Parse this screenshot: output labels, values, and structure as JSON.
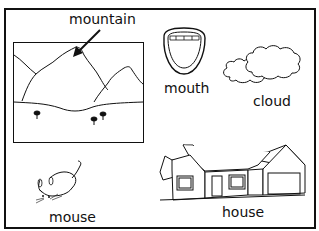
{
  "worksheet": {
    "labels": {
      "mountain": "mountain",
      "mouth": "mouth",
      "cloud": "cloud",
      "mouse": "mouse",
      "house": "house"
    },
    "pictures": [
      {
        "name": "mountain",
        "icon": "mountain-landscape-icon"
      },
      {
        "name": "mouth",
        "icon": "open-mouth-icon"
      },
      {
        "name": "cloud",
        "icon": "cloud-icon"
      },
      {
        "name": "mouse",
        "icon": "mouse-animal-icon"
      },
      {
        "name": "house",
        "icon": "house-icon"
      }
    ]
  }
}
